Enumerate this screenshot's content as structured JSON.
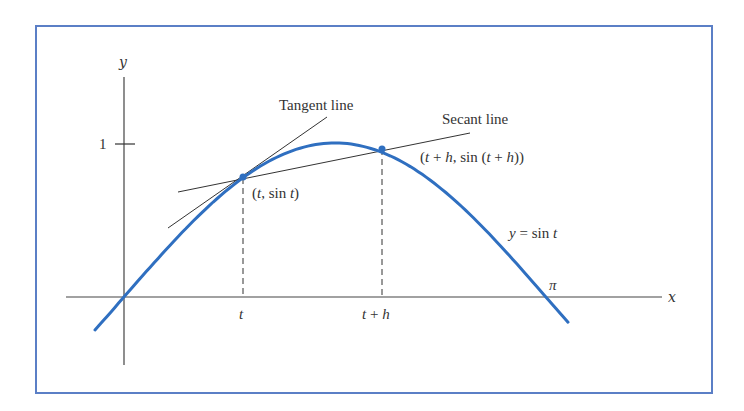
{
  "figure": {
    "frame_color": "#5b7fc6",
    "curve_color": "#2f6fc0",
    "text_color": "#333333"
  },
  "labels": {
    "y_axis": "y",
    "x_axis": "x",
    "y_tick_one": "1",
    "tangent_line": "Tangent line",
    "secant_line": "Secant line",
    "point_t": "(t, sin t)",
    "point_t_h": "(t + h, sin (t + h))",
    "curve_eq": "y = sin t",
    "pi": "π",
    "tick_t": "t",
    "tick_t_h": "t + h"
  },
  "geometry": {
    "origin_px": [
      124,
      297
    ],
    "x_scale_px_per_unit": 134.3,
    "y_scale_px_per_unit": 154,
    "curve_domain": [
      -0.216,
      3.306
    ],
    "t": 0.886,
    "t_plus_h": 1.921,
    "pi": 3.14159
  }
}
